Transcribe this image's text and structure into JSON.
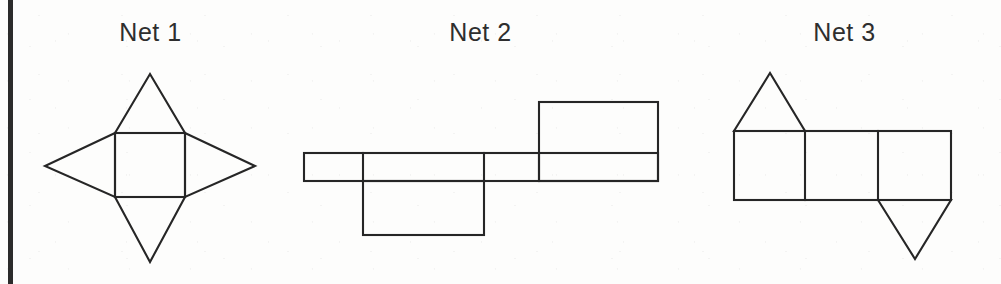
{
  "page": {
    "background_color": "#fdfdfc",
    "ink_color": "#262626",
    "width": 1001,
    "height": 284,
    "margin_rule_color": "#2b2b2b"
  },
  "figures": [
    {
      "id": "net-1",
      "title": "Net 1",
      "description": "square-pyramid-net",
      "shape_type": "square pyramid net",
      "parts": [
        {
          "name": "base-square",
          "kind": "square"
        },
        {
          "name": "triangle-top",
          "kind": "triangle"
        },
        {
          "name": "triangle-right",
          "kind": "triangle"
        },
        {
          "name": "triangle-bottom",
          "kind": "triangle"
        },
        {
          "name": "triangle-left",
          "kind": "triangle"
        }
      ],
      "geometry": {
        "square": {
          "left": 115,
          "top": 133,
          "right": 185,
          "bottom": 197
        },
        "apex_top": [
          150,
          74
        ],
        "apex_right": [
          255,
          166
        ],
        "apex_bottom": [
          150,
          262
        ],
        "apex_left": [
          45,
          166
        ]
      }
    },
    {
      "id": "net-2",
      "title": "Net 2",
      "description": "cuboid-net",
      "shape_type": "cuboid net",
      "parts": [
        {
          "name": "strip-rectangle-1",
          "kind": "rectangle"
        },
        {
          "name": "strip-rectangle-2",
          "kind": "rectangle"
        },
        {
          "name": "strip-rectangle-3",
          "kind": "rectangle"
        },
        {
          "name": "strip-rectangle-4",
          "kind": "rectangle"
        },
        {
          "name": "flap-rectangle-below",
          "kind": "rectangle"
        },
        {
          "name": "flap-rectangle-above",
          "kind": "rectangle"
        }
      ],
      "geometry": {
        "strip": {
          "left": 304,
          "top": 153,
          "right": 658,
          "bottom": 181
        },
        "strip_dividers_x": [
          363,
          484,
          539
        ],
        "flap_below": {
          "left": 363,
          "top": 181,
          "right": 484,
          "bottom": 235
        },
        "flap_above": {
          "left": 539,
          "top": 102,
          "right": 658,
          "bottom": 181
        }
      }
    },
    {
      "id": "net-3",
      "title": "Net 3",
      "description": "triangular-prism-net",
      "shape_type": "triangular prism net",
      "parts": [
        {
          "name": "square-1",
          "kind": "square"
        },
        {
          "name": "square-2",
          "kind": "square"
        },
        {
          "name": "square-3",
          "kind": "square"
        },
        {
          "name": "triangle-above-square-1",
          "kind": "triangle"
        },
        {
          "name": "triangle-below-square-3",
          "kind": "triangle"
        }
      ],
      "geometry": {
        "strip": {
          "left": 734,
          "top": 131,
          "right": 951,
          "bottom": 200
        },
        "strip_dividers_x": [
          805,
          878
        ],
        "triangle_top": [
          [
            734,
            131
          ],
          [
            770,
            73
          ],
          [
            805,
            131
          ]
        ],
        "triangle_bottom": [
          [
            878,
            200
          ],
          [
            915,
            259
          ],
          [
            951,
            200
          ]
        ]
      }
    }
  ]
}
